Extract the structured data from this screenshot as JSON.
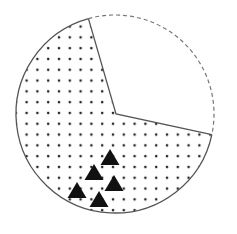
{
  "figure": {
    "type": "circle-diagram",
    "circle": {
      "cx": 115,
      "cy": 114,
      "r": 99,
      "stroke": "#555555"
    },
    "wedge": {
      "vertex": [
        116,
        114
      ],
      "start": [
        88,
        17
      ],
      "end": [
        214,
        135
      ],
      "fill": "#ffffff",
      "outer_edge_style": "dashed"
    },
    "remainder_fill_pattern": "dots",
    "dot_color": "#222222",
    "triangle_color": "#111111",
    "triangles": [
      {
        "cx": 110,
        "cy": 157
      },
      {
        "cx": 94,
        "cy": 172
      },
      {
        "cx": 114,
        "cy": 183
      },
      {
        "cx": 77,
        "cy": 190
      },
      {
        "cx": 99,
        "cy": 199
      }
    ]
  },
  "caption": {
    "text": ""
  }
}
